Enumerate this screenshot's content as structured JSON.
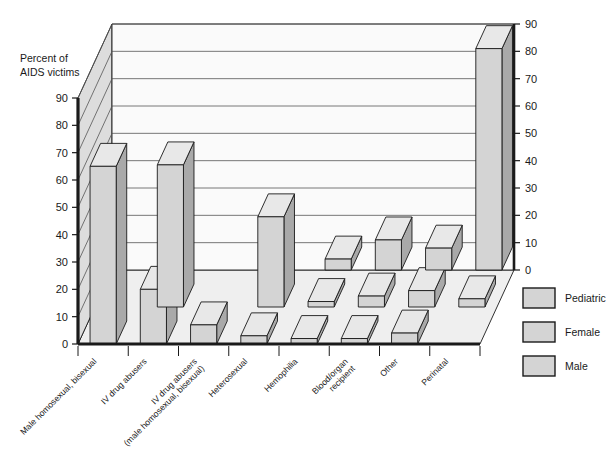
{
  "chart_data": {
    "type": "bar",
    "title": "",
    "subtitle": "",
    "ylabel_line1": "Percent of",
    "ylabel_line2": "AIDS victims",
    "xlabel": "",
    "ylim": [
      0,
      90
    ],
    "grid": true,
    "projection": "3d",
    "legend_position": "right",
    "left_axis_ticks": [
      "0",
      "10",
      "20",
      "30",
      "40",
      "50",
      "60",
      "70",
      "80",
      "90"
    ],
    "right_axis_ticks": [
      "0",
      "10",
      "20",
      "30",
      "40",
      "50",
      "60",
      "70",
      "80",
      "90"
    ],
    "categories": [
      "Male homosexual, bisexual",
      "IV drug abusers",
      "IV drug abusers\n(male homosexual, bisexual)",
      "Heterosexual",
      "Hemophilia",
      "Blood/organ\nrecipient",
      "Other",
      "Perinatal"
    ],
    "category_labels": [
      {
        "line1": "Male homosexual, bisexual",
        "line2": ""
      },
      {
        "line1": "IV drug abusers",
        "line2": ""
      },
      {
        "line1": "IV drug abusers",
        "line2": "(male homosexual, bisexual)"
      },
      {
        "line1": "Heterosexual",
        "line2": ""
      },
      {
        "line1": "Hemophilia",
        "line2": ""
      },
      {
        "line1": "Blood/organ",
        "line2": "recipient"
      },
      {
        "line1": "Other",
        "line2": ""
      },
      {
        "line1": "Perinatal",
        "line2": ""
      }
    ],
    "series": [
      {
        "name": "Pediatric",
        "values": [
          0,
          0,
          0,
          0,
          4,
          11,
          8,
          81
        ]
      },
      {
        "name": "Female",
        "values": [
          0,
          52,
          0,
          33,
          2,
          4,
          6,
          3
        ]
      },
      {
        "name": "Male",
        "values": [
          65,
          20,
          7,
          3,
          2,
          2,
          4,
          0
        ]
      }
    ],
    "colors": {
      "bar_front": "#d4d4d4",
      "bar_side": "#a9a9a9",
      "bar_top": "#e8e8e8",
      "wall_back": "#fafafa",
      "wall_left": "#dddddd",
      "floor": "#efefef",
      "outline": "#1a1a1a",
      "gridline": "#555555",
      "text": "#1a1a1a"
    }
  },
  "legend": {
    "items": [
      {
        "label": "Pediatric"
      },
      {
        "label": "Female"
      },
      {
        "label": "Male"
      }
    ]
  }
}
